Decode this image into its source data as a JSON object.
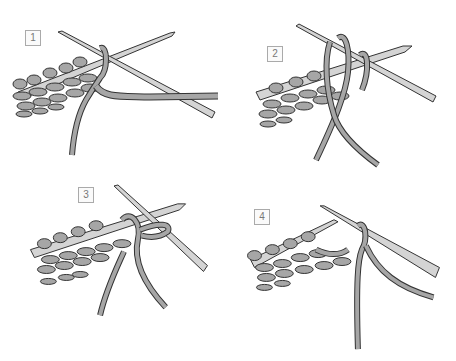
{
  "figure": {
    "colors": {
      "background": "#ffffff",
      "yarn": "#a6a6a6",
      "outline": "#333333",
      "needle": "#d4d4d4",
      "label_border": "#aaaaaa",
      "label_text": "#777777"
    },
    "steps": [
      {
        "label": "1"
      },
      {
        "label": "2"
      },
      {
        "label": "3"
      },
      {
        "label": "4"
      }
    ]
  }
}
